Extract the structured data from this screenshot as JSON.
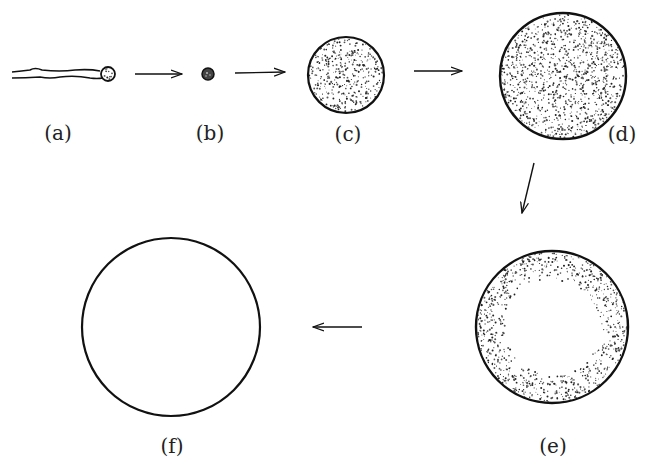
{
  "figure": {
    "stroke_color": "#111111",
    "background": "#ffffff",
    "stages": [
      {
        "id": "a",
        "label": "(a)",
        "shape": "wavy-tube-with-bulb"
      },
      {
        "id": "b",
        "label": "(b)",
        "shape": "small-filled-dot"
      },
      {
        "id": "c",
        "label": "(c)",
        "shape": "stippled-circle-small"
      },
      {
        "id": "d",
        "label": "(d)",
        "shape": "stippled-circle-large"
      },
      {
        "id": "e",
        "label": "(e)",
        "shape": "stippled-ring"
      },
      {
        "id": "f",
        "label": "(f)",
        "shape": "empty-circle"
      }
    ],
    "arrows": [
      {
        "from": "a",
        "to": "b",
        "direction": "right"
      },
      {
        "from": "b",
        "to": "c",
        "direction": "right"
      },
      {
        "from": "c",
        "to": "d",
        "direction": "right"
      },
      {
        "from": "d",
        "to": "e",
        "direction": "down"
      },
      {
        "from": "e",
        "to": "f",
        "direction": "left"
      }
    ]
  }
}
